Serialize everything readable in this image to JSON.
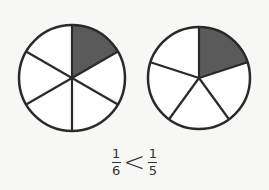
{
  "diagram": {
    "circles": [
      {
        "name": "sixths",
        "parts": 6,
        "shaded": 1,
        "cx": 72,
        "cy": 78,
        "r": 53
      },
      {
        "name": "fifths",
        "parts": 5,
        "shaded": 1,
        "cx": 199,
        "cy": 78,
        "r": 51
      }
    ],
    "colors": {
      "shade": "#5a5a5a",
      "stroke": "#2a2a2a",
      "fill": "#ffffff"
    },
    "caption": {
      "left": {
        "numerator": "1",
        "denominator": "6"
      },
      "operator": "<",
      "right": {
        "numerator": "1",
        "denominator": "5"
      }
    }
  }
}
